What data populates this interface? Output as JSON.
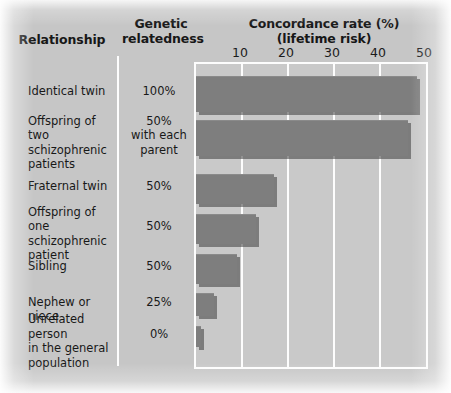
{
  "headers": {
    "relationship": "Relationship",
    "genetic_relatedness": "Genetic\nrelatedness",
    "concordance": "Concordance rate (%)\n(lifetime risk)"
  },
  "colors": {
    "bar_fill": "#7e7e7e",
    "plot_background": "#c9c9c9",
    "gridline": "#fdfdfd",
    "page_background": "#c6c6c6",
    "text": "#181818"
  },
  "chart_data": {
    "type": "bar",
    "orientation": "horizontal",
    "xlabel": "Concordance rate (%) (lifetime risk)",
    "ylabel": "Relationship",
    "xlim": [
      0,
      50
    ],
    "xticks": [
      10,
      20,
      30,
      40,
      50
    ],
    "xtick_labels": [
      "10",
      "20",
      "30",
      "40",
      "50"
    ],
    "grid": true,
    "legend": "none",
    "categories": [
      "Identical twin",
      "Offspring of two schizophrenic patients",
      "Fraternal twin",
      "Offspring of one schizophrenic patient",
      "Sibling",
      "Nephew or niece",
      "Unrelated person in the general population"
    ],
    "values": [
      48,
      46,
      17,
      13,
      9,
      4,
      1
    ],
    "genetic_relatedness": [
      "100%",
      "50% with each parent",
      "50%",
      "50%",
      "50%",
      "25%",
      "0%"
    ]
  },
  "rows": [
    {
      "label": "Identical twin",
      "label_lines": [
        "Identical twin"
      ],
      "relatedness_lines": [
        "100%"
      ],
      "value": 48
    },
    {
      "label": "Offspring of two schizophrenic patients",
      "label_lines": [
        "Offspring of two",
        "schizophrenic",
        "patients"
      ],
      "relatedness_lines": [
        "50%",
        "with each",
        "parent"
      ],
      "value": 46
    },
    {
      "label": "Fraternal twin",
      "label_lines": [
        "Fraternal twin"
      ],
      "relatedness_lines": [
        "50%"
      ],
      "value": 17
    },
    {
      "label": "Offspring of one schizophrenic patient",
      "label_lines": [
        "Offspring of one",
        "schizophrenic",
        "patient"
      ],
      "relatedness_lines": [
        "50%"
      ],
      "value": 13
    },
    {
      "label": "Sibling",
      "label_lines": [
        "Sibling"
      ],
      "relatedness_lines": [
        "50%"
      ],
      "value": 9
    },
    {
      "label": "Nephew or niece",
      "label_lines": [
        "Nephew or niece"
      ],
      "relatedness_lines": [
        "25%"
      ],
      "value": 4
    },
    {
      "label": "Unrelated person in the general population",
      "label_lines": [
        "Unrelated person",
        "in the general",
        "population"
      ],
      "relatedness_lines": [
        "0%"
      ],
      "value": 1
    }
  ]
}
